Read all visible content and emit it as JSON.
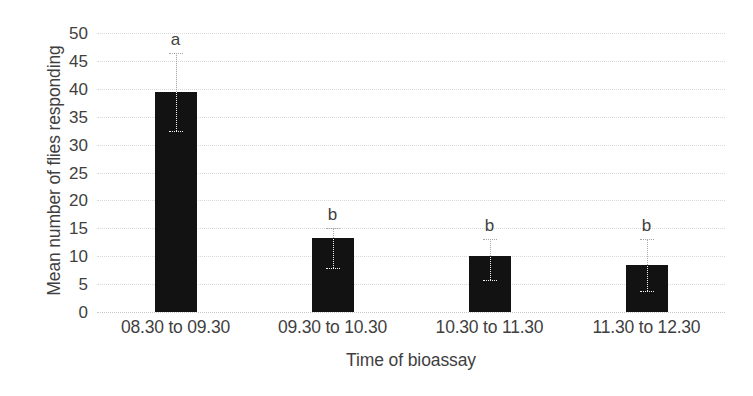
{
  "chart_data": {
    "type": "bar",
    "title": "",
    "xlabel": "Time of bioassay",
    "ylabel": "Mean number of flies responding",
    "categories": [
      "08.30 to 09.30",
      "09.30 to 10.30",
      "10.30 to 11.30",
      "11.30 to 12.30"
    ],
    "values": [
      39.5,
      13.3,
      10.0,
      8.4
    ],
    "error_low": [
      32.5,
      7.9,
      5.8,
      3.8
    ],
    "error_high": [
      46.5,
      15.0,
      13.0,
      13.0
    ],
    "annotations": [
      "a",
      "b",
      "b",
      "b"
    ],
    "ylim": [
      0,
      50
    ],
    "ytick_step": 5,
    "yticks": [
      "50",
      "45",
      "40",
      "35",
      "30",
      "25",
      "20",
      "15",
      "10",
      "5",
      "0"
    ],
    "grid": true,
    "legend": "none",
    "bar_color": "#121212",
    "grid_color": "#d9d9d9",
    "text_color": "#3f3f3f"
  }
}
